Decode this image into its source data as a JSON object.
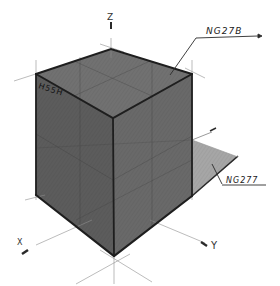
{
  "diagram": {
    "type": "isometric-cube-sketch",
    "background": "#ffffff",
    "axes": {
      "z": {
        "label": "Z"
      },
      "x": {
        "label": "X"
      },
      "y": {
        "label": "Y"
      }
    },
    "labels": {
      "top_face": "NG27B",
      "left_edge": "H55H",
      "shadow_plane": "NG277"
    },
    "colors": {
      "top_face": "#6e6e6e",
      "left_face": "#5a5a5a",
      "right_face": "#6a6a6a",
      "shadow_plane": "#a4a4a4",
      "edge": "#1e1e1e",
      "construction_line": "#9a9a9a"
    }
  }
}
